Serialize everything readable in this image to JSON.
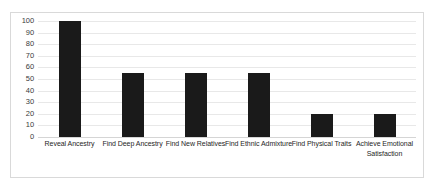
{
  "chart_data": {
    "type": "bar",
    "title": "",
    "subtitle": "",
    "xlabel": "",
    "ylabel": "",
    "categories": [
      "Reveal Ancestry",
      "Find Deep Ancestry",
      "Find New Relatives",
      "Find Ethnic Admixture",
      "Find Physical Traits",
      "Achieve Emotional Satisfaction"
    ],
    "values": [
      100,
      55,
      55,
      55,
      20,
      20
    ],
    "ylim": [
      0,
      100
    ],
    "yticks": [
      100,
      90,
      80,
      70,
      60,
      50,
      40,
      30,
      20,
      10,
      0
    ],
    "ytick_labels": [
      "100",
      "90",
      "80",
      "70",
      "60",
      "50",
      "40",
      "30",
      "20",
      "10",
      "0"
    ],
    "grid": true,
    "legend": false,
    "legend_position": "none",
    "bar_color": "#1a1a1a",
    "gridline_color": "#e8e8e8",
    "border_color": "#d9d9d9",
    "background_color": "#ffffff"
  }
}
